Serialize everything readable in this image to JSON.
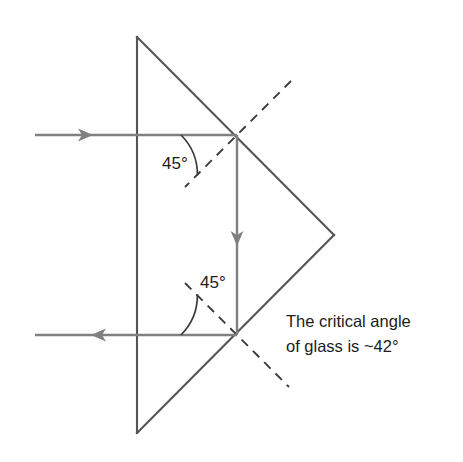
{
  "figure": {
    "background_color": "#ffffff",
    "width": 463,
    "height": 462
  },
  "colors": {
    "prism_outline": "#555555",
    "ray": "#808080",
    "normal_dashed": "#3a3a3a",
    "arc": "#3a3a3a",
    "text": "#1c1c1c"
  },
  "prism": {
    "name": "right-angle-glass-prism",
    "vertices": [
      {
        "label": "apex-top",
        "x": 137,
        "y": 37
      },
      {
        "label": "vertex-right",
        "x": 334,
        "y": 235
      },
      {
        "label": "apex-bottom",
        "x": 137,
        "y": 433
      }
    ]
  },
  "rays": [
    {
      "name": "incident-ray",
      "direction": "rightward",
      "from": {
        "x": 35,
        "y": 135
      },
      "to": {
        "x": 237,
        "y": 135
      },
      "arrow_at": {
        "x": 92,
        "y": 135
      }
    },
    {
      "name": "internal-ray-vertical",
      "direction": "downward",
      "from": {
        "x": 237,
        "y": 135
      },
      "to": {
        "x": 237,
        "y": 335
      },
      "arrow_at": {
        "x": 237,
        "y": 243
      }
    },
    {
      "name": "exit-ray",
      "direction": "leftward",
      "from": {
        "x": 237,
        "y": 335
      },
      "to": {
        "x": 35,
        "y": 335
      },
      "arrow_at": {
        "x": 92,
        "y": 335
      }
    }
  ],
  "normals": [
    {
      "name": "normal-top-dashed",
      "from": {
        "x": 291,
        "y": 81
      },
      "to": {
        "x": 185,
        "y": 187
      }
    },
    {
      "name": "normal-bottom-dashed",
      "from": {
        "x": 185,
        "y": 283
      },
      "to": {
        "x": 289,
        "y": 387
      }
    }
  ],
  "labels": {
    "angle_top": "45°",
    "angle_bottom": "45°",
    "note_line1": "The critical angle",
    "note_line2": "of glass is ~42°"
  },
  "annotations": {
    "angle_top_arc": {
      "name": "angle-arc-top",
      "vertex": {
        "x": 237,
        "y": 135
      },
      "radius": 56,
      "from_deg": 180,
      "to_deg": 225
    },
    "angle_bottom_arc": {
      "name": "angle-arc-bottom",
      "vertex": {
        "x": 237,
        "y": 335
      },
      "radius": 56,
      "from_deg": 180,
      "to_deg": 135
    }
  }
}
